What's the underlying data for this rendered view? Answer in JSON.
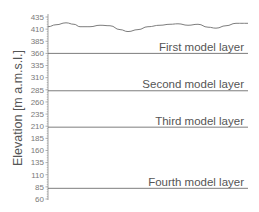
{
  "chart_data": {
    "type": "line",
    "title": "",
    "xlabel": "",
    "ylabel": "Elevation [m a.m.s.l.]",
    "ylim": [
      60,
      435
    ],
    "grid": false,
    "legend": "none",
    "yticks": [
      435,
      410,
      385,
      360,
      335,
      310,
      285,
      260,
      235,
      210,
      185,
      160,
      135,
      110,
      85,
      60
    ],
    "series": [
      {
        "name": "Ground surface",
        "type": "line",
        "x_px": [
          48,
          56,
          66,
          74,
          80,
          90,
          100,
          110,
          120,
          128,
          138,
          148,
          160,
          170,
          178,
          188,
          198,
          208,
          216,
          226,
          236,
          248
        ],
        "values": [
          415,
          419,
          423,
          420,
          415,
          415,
          418,
          417,
          409,
          405,
          409,
          415,
          418,
          420,
          421,
          418,
          420,
          414,
          412,
          417,
          422,
          422
        ]
      },
      {
        "name": "First model layer",
        "type": "hline",
        "value": 360
      },
      {
        "name": "Second model layer",
        "type": "hline",
        "value": 283
      },
      {
        "name": "Third model layer",
        "type": "hline",
        "value": 208
      },
      {
        "name": "Fourth model layer",
        "type": "hline",
        "value": 82
      }
    ],
    "annotations": [
      {
        "text": "First model layer",
        "y": 360
      },
      {
        "text": "Second model layer",
        "y": 283
      },
      {
        "text": "Third model layer",
        "y": 208
      },
      {
        "text": "Fourth model layer",
        "y": 82
      }
    ]
  },
  "colors": {
    "line": "#6e6e6e",
    "axis": "#8a8a8a",
    "text": "#555555"
  }
}
